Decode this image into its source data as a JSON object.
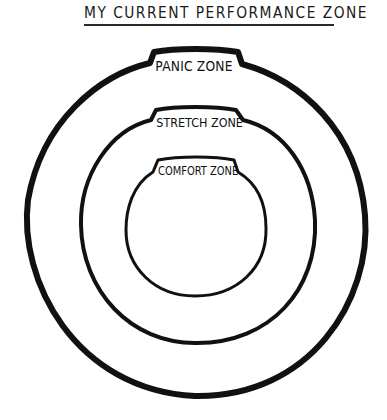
{
  "title": "MY CURRENT PERFORMANCE ZONE",
  "zones": [
    {
      "label": "PANIC ZONE",
      "level": "outer"
    },
    {
      "label": "STRETCH ZONE",
      "level": "middle"
    },
    {
      "label": "COMFORT ZONE",
      "level": "inner"
    }
  ],
  "colors": {
    "ink": "#111111",
    "background": "#ffffff"
  }
}
